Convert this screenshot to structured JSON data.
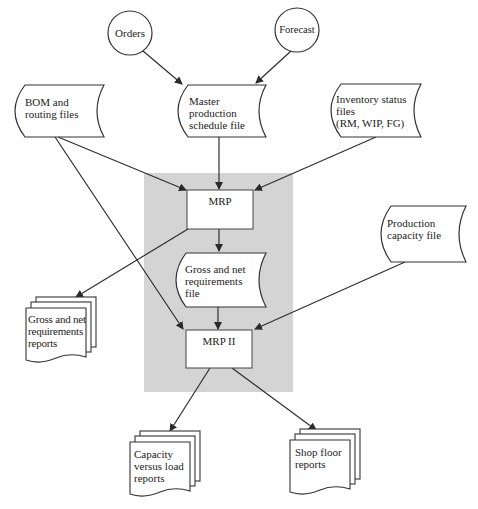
{
  "colors": {
    "background": "#ffffff",
    "system_region": "#d4d4d4",
    "stroke": "#3a3a3a",
    "node_fill": "#ffffff",
    "text": "#222222"
  },
  "nodes": {
    "orders": {
      "label": "Orders",
      "shape": "circle"
    },
    "forecast": {
      "label": "Forecast",
      "shape": "circle"
    },
    "bom": {
      "label": "BOM and\nrouting files",
      "shape": "stored-data"
    },
    "mps": {
      "label": "Master\nproduction\nschedule file",
      "shape": "stored-data"
    },
    "inventory": {
      "label": "Inventory status\nfiles\n(RM, WIP, FG)",
      "shape": "stored-data"
    },
    "mrp": {
      "label": "MRP",
      "shape": "process"
    },
    "gross_net_file": {
      "label": "Gross and net\nrequirements\nfile",
      "shape": "stored-data"
    },
    "capacity_file": {
      "label": "Production\ncapacity file",
      "shape": "stored-data"
    },
    "mrp2": {
      "label": "MRP II",
      "shape": "process"
    },
    "gross_net_reports": {
      "label": "Gross and net\nrequirements\nreports",
      "shape": "multi-document"
    },
    "capacity_reports": {
      "label": "Capacity\nversus load\nreports",
      "shape": "multi-document"
    },
    "shop_floor_reports": {
      "label": "Shop floor\nreports",
      "shape": "multi-document"
    }
  },
  "edges": [
    {
      "from": "orders",
      "to": "mps"
    },
    {
      "from": "forecast",
      "to": "mps"
    },
    {
      "from": "bom",
      "to": "mrp"
    },
    {
      "from": "mps",
      "to": "mrp"
    },
    {
      "from": "inventory",
      "to": "mrp"
    },
    {
      "from": "mrp",
      "to": "gross_net_file"
    },
    {
      "from": "mrp",
      "to": "gross_net_reports"
    },
    {
      "from": "bom",
      "to": "mrp2"
    },
    {
      "from": "gross_net_file",
      "to": "mrp2"
    },
    {
      "from": "capacity_file",
      "to": "mrp2"
    },
    {
      "from": "mrp2",
      "to": "capacity_reports"
    },
    {
      "from": "mrp2",
      "to": "shop_floor_reports"
    }
  ]
}
